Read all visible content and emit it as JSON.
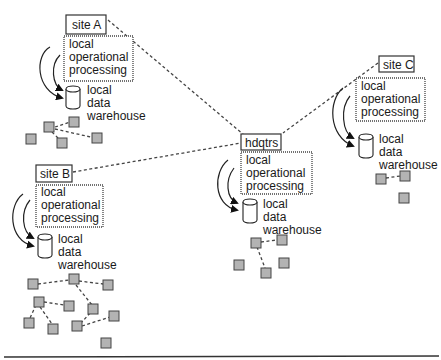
{
  "diagram": {
    "type": "distributed data warehouse topology",
    "sites": [
      {
        "id": "siteA",
        "label": "site A",
        "processing": [
          "local",
          "operational",
          "processing"
        ],
        "warehouse": [
          "local",
          "data",
          "warehouse"
        ]
      },
      {
        "id": "siteB",
        "label": "site B",
        "processing": [
          "local",
          "operational",
          "processing"
        ],
        "warehouse": [
          "local",
          "data",
          "warehouse"
        ]
      },
      {
        "id": "hdqtrs",
        "label": "hdqtrs",
        "processing": [
          "local",
          "operational",
          "processing"
        ],
        "warehouse": [
          "local",
          "data",
          "warehouse"
        ]
      },
      {
        "id": "siteC",
        "label": "site C",
        "processing": [
          "local",
          "operational",
          "processing"
        ],
        "warehouse": [
          "local",
          "data",
          "warehouse"
        ]
      }
    ],
    "connections": [
      {
        "from": "siteA",
        "to": "hdqtrs"
      },
      {
        "from": "siteB",
        "to": "hdqtrs"
      },
      {
        "from": "siteC",
        "to": "hdqtrs"
      }
    ],
    "colors": {
      "node_fill": "#b3b3b3",
      "stroke": "#333333",
      "background": "#ffffff"
    }
  }
}
